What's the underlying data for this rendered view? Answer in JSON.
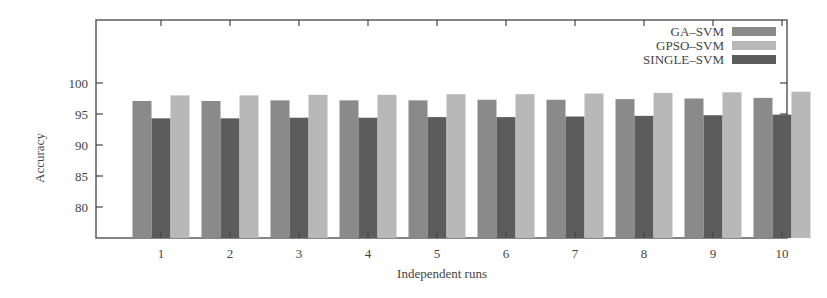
{
  "chart_data": {
    "type": "bar",
    "title": "",
    "xlabel": "Independent runs",
    "ylabel": "Accuracy",
    "categories": [
      "1",
      "2",
      "3",
      "4",
      "5",
      "6",
      "7",
      "8",
      "9",
      "10"
    ],
    "yticks": [
      80,
      85,
      90,
      95,
      100
    ],
    "ylim": [
      75,
      110
    ],
    "grid": false,
    "legend_position": "top-right",
    "series": [
      {
        "name": "GA–SVM",
        "color": "#8a8a8a",
        "values": [
          97.1,
          97.1,
          97.2,
          97.2,
          97.2,
          97.3,
          97.3,
          97.4,
          97.5,
          97.6
        ]
      },
      {
        "name": "SINGLE–SVM",
        "color": "#5c5c5c",
        "values": [
          94.3,
          94.3,
          94.4,
          94.4,
          94.5,
          94.5,
          94.6,
          94.7,
          94.8,
          94.9
        ]
      },
      {
        "name": "GPSO–SVM",
        "color": "#b8b8b8",
        "values": [
          98.0,
          98.0,
          98.1,
          98.1,
          98.2,
          98.2,
          98.3,
          98.4,
          98.5,
          98.6
        ]
      }
    ],
    "legend_order": [
      "GA–SVM",
      "GPSO–SVM",
      "SINGLE–SVM"
    ]
  }
}
